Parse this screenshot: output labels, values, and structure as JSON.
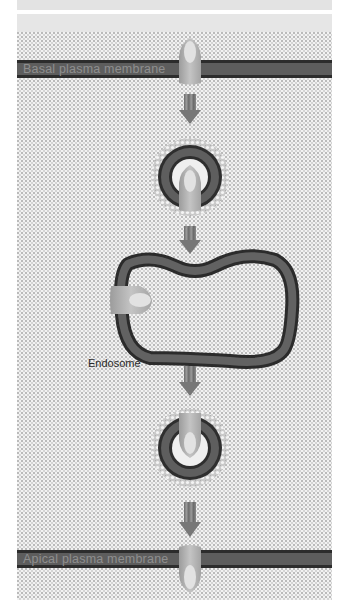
{
  "diagram": {
    "labels": {
      "basal_membrane": "Basal plasma membrane",
      "apical_membrane": "Apical plasma membrane",
      "endosome": "Endosome"
    },
    "stages": [
      {
        "name": "basal-membrane-receptor",
        "y": 69
      },
      {
        "name": "coated-vesicle-1",
        "y": 178
      },
      {
        "name": "endosome",
        "y": 310
      },
      {
        "name": "coated-vesicle-2",
        "y": 447
      },
      {
        "name": "apical-membrane-receptor",
        "y": 559
      }
    ],
    "colors": {
      "membrane_outer": "#2c2c2c",
      "membrane_inner": "#5d5d5d",
      "background_stipple": "#f2f2f2",
      "arrow": "#7a7a7a",
      "receptor": "#b5b5b5",
      "receptor_highlight": "#e2e2e2"
    }
  }
}
